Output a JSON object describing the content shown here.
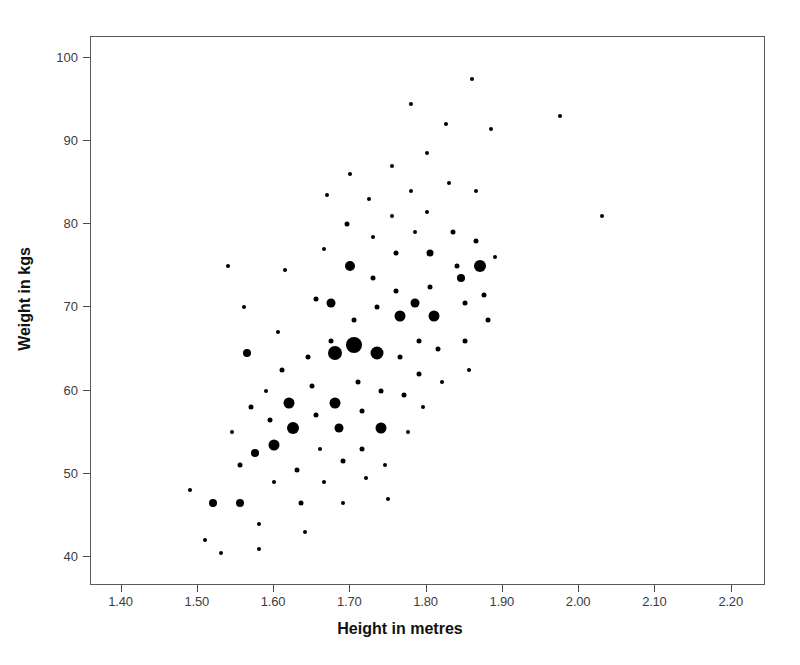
{
  "chart_data": {
    "type": "scatter",
    "title": "",
    "xlabel": "Height in metres",
    "ylabel": "Weight in kgs",
    "xlim": [
      1.36,
      2.245
    ],
    "ylim": [
      36.5,
      102.5
    ],
    "xticks": [
      "1.40",
      "1.50",
      "1.60",
      "1.70",
      "1.80",
      "1.90",
      "2.00",
      "2.10",
      "2.20"
    ],
    "xtick_values": [
      1.4,
      1.5,
      1.6,
      1.7,
      1.8,
      1.9,
      2.0,
      2.1,
      2.2
    ],
    "yticks": [
      "40",
      "50",
      "60",
      "70",
      "80",
      "90",
      "100"
    ],
    "ytick_values": [
      40,
      50,
      60,
      70,
      80,
      90,
      100
    ],
    "grid": false,
    "legend": null,
    "marker_color": "#000000",
    "marker_shape": "circle",
    "marker_size_meaning": "count of cases at that height/weight combination",
    "marker_size_range": [
      3,
      16
    ],
    "points": [
      {
        "x": 1.49,
        "y": 48,
        "s": 4
      },
      {
        "x": 1.51,
        "y": 42,
        "s": 4
      },
      {
        "x": 1.52,
        "y": 46.5,
        "s": 8
      },
      {
        "x": 1.53,
        "y": 40.5,
        "s": 4
      },
      {
        "x": 1.54,
        "y": 75,
        "s": 4
      },
      {
        "x": 1.545,
        "y": 55,
        "s": 4
      },
      {
        "x": 1.555,
        "y": 51,
        "s": 5
      },
      {
        "x": 1.555,
        "y": 46.5,
        "s": 8
      },
      {
        "x": 1.56,
        "y": 70,
        "s": 4
      },
      {
        "x": 1.565,
        "y": 64.5,
        "s": 8
      },
      {
        "x": 1.57,
        "y": 58,
        "s": 5
      },
      {
        "x": 1.575,
        "y": 52.5,
        "s": 8
      },
      {
        "x": 1.58,
        "y": 44,
        "s": 4
      },
      {
        "x": 1.58,
        "y": 41,
        "s": 4
      },
      {
        "x": 1.59,
        "y": 60,
        "s": 4
      },
      {
        "x": 1.595,
        "y": 56.5,
        "s": 5
      },
      {
        "x": 1.6,
        "y": 53.5,
        "s": 11
      },
      {
        "x": 1.6,
        "y": 49,
        "s": 4
      },
      {
        "x": 1.605,
        "y": 67,
        "s": 4
      },
      {
        "x": 1.61,
        "y": 62.5,
        "s": 5
      },
      {
        "x": 1.615,
        "y": 74.5,
        "s": 4
      },
      {
        "x": 1.62,
        "y": 58.5,
        "s": 11
      },
      {
        "x": 1.625,
        "y": 55.5,
        "s": 12
      },
      {
        "x": 1.63,
        "y": 50.5,
        "s": 5
      },
      {
        "x": 1.635,
        "y": 46.5,
        "s": 5
      },
      {
        "x": 1.64,
        "y": 43,
        "s": 4
      },
      {
        "x": 1.645,
        "y": 64,
        "s": 5
      },
      {
        "x": 1.65,
        "y": 60.5,
        "s": 5
      },
      {
        "x": 1.655,
        "y": 71,
        "s": 5
      },
      {
        "x": 1.655,
        "y": 57,
        "s": 5
      },
      {
        "x": 1.66,
        "y": 53,
        "s": 4
      },
      {
        "x": 1.665,
        "y": 49,
        "s": 4
      },
      {
        "x": 1.665,
        "y": 77,
        "s": 4
      },
      {
        "x": 1.67,
        "y": 83.5,
        "s": 4
      },
      {
        "x": 1.675,
        "y": 70.5,
        "s": 9
      },
      {
        "x": 1.675,
        "y": 66,
        "s": 5
      },
      {
        "x": 1.68,
        "y": 64.5,
        "s": 14
      },
      {
        "x": 1.68,
        "y": 58.5,
        "s": 11
      },
      {
        "x": 1.685,
        "y": 55.5,
        "s": 9
      },
      {
        "x": 1.69,
        "y": 51.5,
        "s": 5
      },
      {
        "x": 1.69,
        "y": 46.5,
        "s": 4
      },
      {
        "x": 1.695,
        "y": 80,
        "s": 5
      },
      {
        "x": 1.7,
        "y": 86,
        "s": 4
      },
      {
        "x": 1.7,
        "y": 75,
        "s": 10
      },
      {
        "x": 1.705,
        "y": 68.5,
        "s": 5
      },
      {
        "x": 1.705,
        "y": 65.5,
        "s": 16
      },
      {
        "x": 1.71,
        "y": 61,
        "s": 5
      },
      {
        "x": 1.715,
        "y": 57.5,
        "s": 5
      },
      {
        "x": 1.715,
        "y": 53,
        "s": 5
      },
      {
        "x": 1.72,
        "y": 49.5,
        "s": 4
      },
      {
        "x": 1.725,
        "y": 83,
        "s": 4
      },
      {
        "x": 1.73,
        "y": 78.5,
        "s": 4
      },
      {
        "x": 1.73,
        "y": 73.5,
        "s": 5
      },
      {
        "x": 1.735,
        "y": 70,
        "s": 5
      },
      {
        "x": 1.735,
        "y": 64.5,
        "s": 13
      },
      {
        "x": 1.74,
        "y": 60,
        "s": 5
      },
      {
        "x": 1.74,
        "y": 55.5,
        "s": 11
      },
      {
        "x": 1.745,
        "y": 51,
        "s": 4
      },
      {
        "x": 1.75,
        "y": 47,
        "s": 4
      },
      {
        "x": 1.755,
        "y": 87,
        "s": 4
      },
      {
        "x": 1.755,
        "y": 81,
        "s": 4
      },
      {
        "x": 1.76,
        "y": 76.5,
        "s": 5
      },
      {
        "x": 1.76,
        "y": 72,
        "s": 5
      },
      {
        "x": 1.765,
        "y": 69,
        "s": 11
      },
      {
        "x": 1.765,
        "y": 64,
        "s": 5
      },
      {
        "x": 1.77,
        "y": 59.5,
        "s": 5
      },
      {
        "x": 1.775,
        "y": 55,
        "s": 4
      },
      {
        "x": 1.78,
        "y": 94.5,
        "s": 4
      },
      {
        "x": 1.78,
        "y": 84,
        "s": 4
      },
      {
        "x": 1.785,
        "y": 79,
        "s": 4
      },
      {
        "x": 1.785,
        "y": 70.5,
        "s": 9
      },
      {
        "x": 1.79,
        "y": 66,
        "s": 5
      },
      {
        "x": 1.79,
        "y": 62,
        "s": 5
      },
      {
        "x": 1.795,
        "y": 58,
        "s": 4
      },
      {
        "x": 1.8,
        "y": 88.5,
        "s": 4
      },
      {
        "x": 1.8,
        "y": 81.5,
        "s": 4
      },
      {
        "x": 1.805,
        "y": 76.5,
        "s": 7
      },
      {
        "x": 1.805,
        "y": 72.5,
        "s": 5
      },
      {
        "x": 1.81,
        "y": 69,
        "s": 11
      },
      {
        "x": 1.815,
        "y": 65,
        "s": 5
      },
      {
        "x": 1.82,
        "y": 61,
        "s": 4
      },
      {
        "x": 1.825,
        "y": 92,
        "s": 4
      },
      {
        "x": 1.83,
        "y": 85,
        "s": 4
      },
      {
        "x": 1.835,
        "y": 79,
        "s": 5
      },
      {
        "x": 1.84,
        "y": 75,
        "s": 5
      },
      {
        "x": 1.845,
        "y": 73.5,
        "s": 8
      },
      {
        "x": 1.85,
        "y": 70.5,
        "s": 5
      },
      {
        "x": 1.85,
        "y": 66,
        "s": 5
      },
      {
        "x": 1.855,
        "y": 62.5,
        "s": 4
      },
      {
        "x": 1.86,
        "y": 97.5,
        "s": 4
      },
      {
        "x": 1.865,
        "y": 84,
        "s": 4
      },
      {
        "x": 1.865,
        "y": 78,
        "s": 5
      },
      {
        "x": 1.87,
        "y": 75,
        "s": 12
      },
      {
        "x": 1.875,
        "y": 71.5,
        "s": 5
      },
      {
        "x": 1.88,
        "y": 68.5,
        "s": 5
      },
      {
        "x": 1.885,
        "y": 91.5,
        "s": 4
      },
      {
        "x": 1.89,
        "y": 76,
        "s": 4
      },
      {
        "x": 1.975,
        "y": 93,
        "s": 4
      },
      {
        "x": 2.03,
        "y": 81,
        "s": 4
      }
    ]
  },
  "axes": {
    "x_title": "Height in metres",
    "y_title": "Weight in kgs"
  }
}
